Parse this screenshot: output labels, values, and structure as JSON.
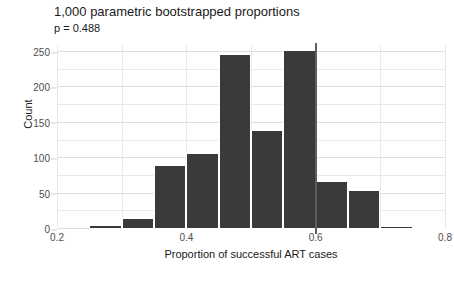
{
  "chart_data": {
    "type": "bar",
    "title": "1,000 parametric bootstrapped proportions",
    "subtitle": "p = 0.488",
    "xlabel": "Proportion of successful ART cases",
    "ylabel": "Count",
    "xlim": [
      0.2,
      0.8
    ],
    "ylim": [
      0,
      260
    ],
    "grid": true,
    "legend": "none",
    "bin_width": 0.05,
    "xticks": [
      "0.2",
      "0.4",
      "0.6",
      "0.8"
    ],
    "xtick_values": [
      0.2,
      0.4,
      0.6,
      0.8
    ],
    "yticks": [
      "0",
      "50",
      "100",
      "150",
      "200",
      "250"
    ],
    "ytick_values": [
      0,
      50,
      100,
      150,
      200,
      250
    ],
    "bins": [
      {
        "x0": 0.25,
        "x1": 0.3,
        "value": 5
      },
      {
        "x0": 0.3,
        "x1": 0.35,
        "value": 16
      },
      {
        "x0": 0.35,
        "x1": 0.4,
        "value": 90
      },
      {
        "x0": 0.4,
        "x1": 0.45,
        "value": 107
      },
      {
        "x0": 0.45,
        "x1": 0.5,
        "value": 247
      },
      {
        "x0": 0.5,
        "x1": 0.55,
        "value": 140
      },
      {
        "x0": 0.55,
        "x1": 0.6,
        "value": 253
      },
      {
        "x0": 0.6,
        "x1": 0.65,
        "value": 68
      },
      {
        "x0": 0.65,
        "x1": 0.7,
        "value": 55
      },
      {
        "x0": 0.7,
        "x1": 0.75,
        "value": 4
      },
      {
        "x0": 0.75,
        "x1": 0.8,
        "value": 1
      }
    ],
    "annotations": [
      {
        "type": "vline",
        "x": 0.6,
        "color": "#5e5e5e",
        "label": "observed proportion"
      }
    ],
    "colors": {
      "bar": "#3a3a3a",
      "vline": "#5e5e5e",
      "grid": "#e9e9e9",
      "text": "#1a1a1a",
      "tick_text": "#4d4d4d",
      "background": "#ffffff"
    }
  }
}
